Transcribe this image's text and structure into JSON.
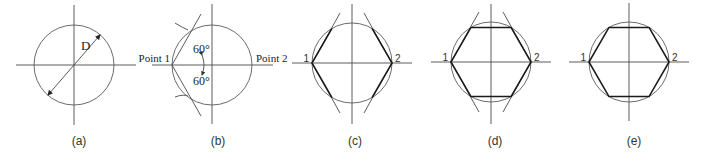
{
  "figure": {
    "panels": [
      {
        "caption": "(a)",
        "labels": {
          "diameter": "D"
        }
      },
      {
        "caption": "(b)",
        "labels": {
          "point1": "Point 1",
          "point2": "Point 2",
          "angle_top": "60°",
          "angle_bottom": "60°"
        }
      },
      {
        "caption": "(c)",
        "labels": {
          "point1": "1",
          "point2": "2"
        }
      },
      {
        "caption": "(d)",
        "labels": {
          "point1": "1",
          "point2": "2"
        }
      },
      {
        "caption": "(e)",
        "labels": {
          "point1": "1",
          "point2": "2"
        }
      }
    ]
  }
}
